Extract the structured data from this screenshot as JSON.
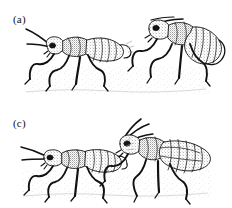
{
  "figure": {
    "title_visible": false,
    "background_color": "#ffffff",
    "ink_color": "#111111",
    "fill_light": "#e8e8e8",
    "fill_mid": "#bdbdbd",
    "fill_dark": "#6e6e6e",
    "width_px": 232,
    "height_px": 208,
    "style": "black-and-white stippled scientific line drawing"
  },
  "panels": [
    {
      "id": "a",
      "label": "(a)",
      "caption_text": "",
      "subject": "pair-of-insects",
      "description_visible": false,
      "figures": [
        {
          "name": "left-insect",
          "facing": "left",
          "parts": [
            "antennae",
            "head",
            "eye",
            "thorax",
            "segmented-abdomen",
            "legs",
            "tarsi"
          ]
        },
        {
          "name": "right-insect",
          "facing": "left",
          "parts": [
            "antennae",
            "head",
            "eye",
            "thorax",
            "segmented-abdomen",
            "legs",
            "tarsi"
          ]
        }
      ],
      "ground_shadow": true
    },
    {
      "id": "c",
      "label": "(c)",
      "caption_text": "",
      "subject": "pair-of-insects",
      "description_visible": false,
      "figures": [
        {
          "name": "left-insect",
          "facing": "left",
          "parts": [
            "antennae",
            "head",
            "eye",
            "thorax",
            "segmented-abdomen",
            "legs",
            "tarsi"
          ]
        },
        {
          "name": "right-insect",
          "facing": "left",
          "parts": [
            "antennae",
            "head",
            "eye",
            "thorax",
            "segmented-abdomen",
            "legs",
            "tarsi"
          ]
        }
      ],
      "ground_shadow": true
    }
  ]
}
